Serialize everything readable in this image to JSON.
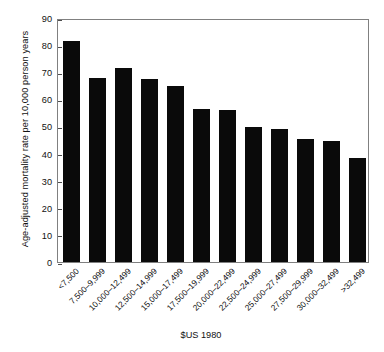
{
  "chart_data": {
    "type": "bar",
    "title": "",
    "xlabel": "$US 1980",
    "ylabel": "Age-adjusted mortality rate per 10,000 person years",
    "ylim": [
      0,
      90
    ],
    "yticks": [
      0,
      10,
      20,
      30,
      40,
      50,
      60,
      70,
      80,
      90
    ],
    "grid": false,
    "legend": "none",
    "bar_color": "#0a0a0a",
    "categories": [
      "<7,500",
      "7,500–9,999",
      "10,000–12,499",
      "12,500–14,999",
      "15,000–17,499",
      "17,500–19,999",
      "20,000–22,499",
      "22,500–24,999",
      "25,000–27,499",
      "27,500–29,999",
      "30,000–32,499",
      ">32,499"
    ],
    "values": [
      81.5,
      67.8,
      71.5,
      67.6,
      65.0,
      56.5,
      56.0,
      49.8,
      49.0,
      45.3,
      44.5,
      38.3
    ]
  }
}
